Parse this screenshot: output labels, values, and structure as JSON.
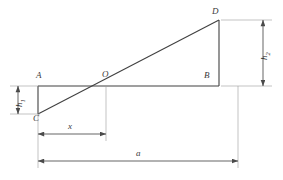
{
  "figure": {
    "stroke_color": "#404040",
    "dimension_color": "#4a4a4a",
    "background_color": "#ffffff"
  },
  "points": [
    {
      "id": "A",
      "label": "A",
      "x": 38,
      "y": 86,
      "label_x": 36,
      "label_y": 71
    },
    {
      "id": "O",
      "label": "O",
      "x": 106,
      "y": 86,
      "label_x": 102,
      "label_y": 70
    },
    {
      "id": "B",
      "label": "B",
      "x": 219,
      "y": 86,
      "label_x": 204,
      "label_y": 71
    },
    {
      "id": "C",
      "label": "C",
      "x": 38,
      "y": 114,
      "label_x": 33,
      "label_y": 114
    },
    {
      "id": "D",
      "label": "D",
      "x": 219,
      "y": 20,
      "label_x": 212,
      "label_y": 7
    }
  ],
  "segments": [
    {
      "id": "AB",
      "name": "baseline",
      "from": "A",
      "to": "B"
    },
    {
      "id": "AC",
      "name": "left-vertical",
      "from": "A",
      "to": "C"
    },
    {
      "id": "BD",
      "name": "right-vertical",
      "from": "B",
      "to": "D"
    },
    {
      "id": "CD",
      "name": "diagonal",
      "from": "C",
      "to": "D"
    }
  ],
  "dimensions": [
    {
      "id": "h1",
      "label": "h",
      "subscript": "1",
      "orientation": "vertical",
      "position": "left",
      "from_y": 86,
      "to_y": 114,
      "axis_x": 18,
      "label_x": 15,
      "label_y": 107
    },
    {
      "id": "h2",
      "label": "h",
      "subscript": "2",
      "orientation": "vertical",
      "position": "right",
      "from_y": 20,
      "to_y": 86,
      "axis_x": 263,
      "label_x": 260,
      "label_y": 60
    },
    {
      "id": "x",
      "label": "x",
      "subscript": "",
      "orientation": "horizontal",
      "position": "lower",
      "from_x": 38,
      "to_x": 106,
      "axis_y": 134,
      "label_x": 68,
      "label_y": 122
    },
    {
      "id": "a",
      "label": "a",
      "subscript": "",
      "orientation": "horizontal",
      "position": "bottom",
      "from_x": 38,
      "to_x": 238,
      "axis_y": 161,
      "label_x": 136,
      "label_y": 149
    }
  ]
}
